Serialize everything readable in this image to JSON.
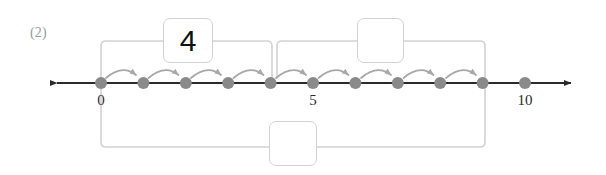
{
  "problem": {
    "label": "(2)"
  },
  "number_line": {
    "axis_color": "#2b2b2b",
    "dot_color": "#8a8a8a",
    "bracket_color": "#d2d2d2",
    "arc_color": "#a8a8a8",
    "min": 0,
    "max": 11,
    "tick_labels": [
      {
        "value": "0",
        "at": 0
      },
      {
        "value": "5",
        "at": 5
      },
      {
        "value": "10",
        "at": 10
      }
    ],
    "dots": [
      0,
      1,
      2,
      3,
      4,
      5,
      6,
      7,
      8,
      9,
      10,
      11
    ],
    "hop_arcs": [
      {
        "from": 0,
        "to": 1
      },
      {
        "from": 1,
        "to": 2
      },
      {
        "from": 2,
        "to": 3
      },
      {
        "from": 3,
        "to": 4
      },
      {
        "from": 4,
        "to": 5
      },
      {
        "from": 5,
        "to": 6
      },
      {
        "from": 6,
        "to": 7
      },
      {
        "from": 7,
        "to": 8
      },
      {
        "from": 8,
        "to": 9
      },
      {
        "from": 9,
        "to": 10
      }
    ]
  },
  "brackets": {
    "top_left": {
      "from": 0,
      "to": 4,
      "box_value": "4"
    },
    "top_right": {
      "from": 4,
      "to": 9,
      "box_value": ""
    },
    "bottom_total": {
      "from": 0,
      "to": 9,
      "box_value": ""
    }
  }
}
